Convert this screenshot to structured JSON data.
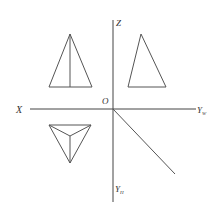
{
  "diagram": {
    "colors": {
      "line": "#555555",
      "axis": "#444444",
      "label": "#333333",
      "background": "#ffffff"
    },
    "axes": {
      "origin_label": "O",
      "x_label": "X",
      "z_label": "Z",
      "yw_label": "Y",
      "yw_sub": "W",
      "yh_label": "Y",
      "yh_sub": "H"
    },
    "views": [
      {
        "name": "front-view",
        "shape": "isosceles triangle with vertical median"
      },
      {
        "name": "side-view",
        "shape": "triangle"
      },
      {
        "name": "top-view",
        "shape": "inverted triangle with lines to interior point"
      }
    ]
  }
}
